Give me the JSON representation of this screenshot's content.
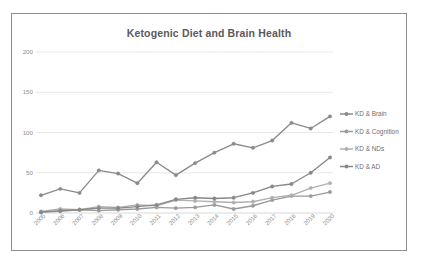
{
  "chart_data": {
    "type": "line",
    "title": "Ketogenic Diet and Brain Health",
    "xlabel": "",
    "ylabel": "",
    "ylim": [
      0,
      200
    ],
    "yticks": [
      0,
      50,
      100,
      150,
      200
    ],
    "grid": true,
    "legend_position": "right",
    "categories": [
      "2005",
      "2006",
      "2007",
      "2008",
      "2009",
      "2010",
      "2011",
      "2012",
      "2013",
      "2014",
      "2015",
      "2016",
      "2017",
      "2018",
      "2019",
      "2020"
    ],
    "series": [
      {
        "name": "KD & Brain",
        "color": "#8b8b8b",
        "values": [
          22,
          30,
          25,
          53,
          49,
          37,
          63,
          47,
          62,
          75,
          86,
          81,
          90,
          112,
          105,
          120
        ]
      },
      {
        "name": "KD & Cognition",
        "color": "#9a9a9a",
        "values": [
          1,
          2,
          4,
          3,
          4,
          5,
          7,
          6,
          7,
          10,
          5,
          9,
          16,
          21,
          21,
          26
        ]
      },
      {
        "name": "KD & NDs",
        "color": "#b0b0b0",
        "values": [
          2,
          5,
          4,
          8,
          7,
          10,
          9,
          16,
          15,
          14,
          13,
          14,
          19,
          22,
          31,
          37
        ]
      },
      {
        "name": "KD & AD",
        "color": "#878787",
        "values": [
          1,
          3,
          4,
          6,
          6,
          8,
          10,
          17,
          19,
          18,
          19,
          25,
          33,
          36,
          50,
          69
        ]
      }
    ]
  },
  "colors": {
    "frame_border": "#8c8c8c",
    "title_text": "#5a5a5a",
    "tick_text": "#8d8d8d",
    "gridline": "#d6d6d6",
    "background": "#ffffff"
  }
}
